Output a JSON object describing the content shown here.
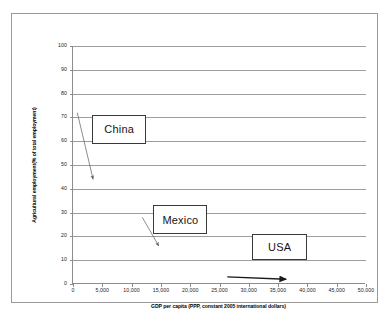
{
  "chart_data": {
    "type": "scatter",
    "title": "",
    "xlabel": "GDP per capita (PPP, constant 2005 international dollars)",
    "ylabel": "Agricultural employment(% of total employment)",
    "xlim": [
      0,
      50000
    ],
    "ylim": [
      0,
      100
    ],
    "grid": true,
    "grid_axis": "y",
    "legend": "none",
    "x_ticks": [
      "0",
      "5,000",
      "10,000",
      "15,000",
      "20,000",
      "25,000",
      "30,000",
      "35,000",
      "40,000",
      "45,000",
      "50,000"
    ],
    "x_tick_values": [
      0,
      5000,
      10000,
      15000,
      20000,
      25000,
      30000,
      35000,
      40000,
      45000,
      50000
    ],
    "y_ticks": [
      "0",
      "10",
      "20",
      "30",
      "40",
      "50",
      "60",
      "70",
      "80",
      "90",
      "100"
    ],
    "y_tick_values": [
      0,
      10,
      20,
      30,
      40,
      50,
      60,
      70,
      80,
      90,
      100
    ],
    "annotations": [
      {
        "label": "China",
        "box": {
          "x0": 3400,
          "x1": 12700,
          "y0": 59,
          "y1": 71
        },
        "arrow": {
          "x_start": 900,
          "y_start": 72,
          "x_end": 3600,
          "y_end": 44
        }
      },
      {
        "label": "Mexico",
        "box": {
          "x0": 13900,
          "x1": 23100,
          "y0": 21,
          "y1": 33
        },
        "arrow": {
          "x_start": 12000,
          "y_start": 28,
          "x_end": 14800,
          "y_end": 16
        }
      },
      {
        "label": "USA",
        "box": {
          "x0": 30800,
          "x1": 40100,
          "y0": 10,
          "y1": 21
        },
        "arrow": {
          "x_start": 26500,
          "y_start": 3,
          "x_end": 36500,
          "y_end": 2
        }
      }
    ],
    "series": [
      {
        "name": "China",
        "x": [
          900,
          3600
        ],
        "y": [
          72,
          44
        ]
      },
      {
        "name": "Mexico",
        "x": [
          12000,
          14800
        ],
        "y": [
          28,
          16
        ]
      },
      {
        "name": "USA",
        "x": [
          26500,
          36500
        ],
        "y": [
          3,
          2
        ]
      }
    ],
    "colors": {
      "axis": "#8c8c8c",
      "grid": "#9d9d9d",
      "frame": "#9a9a9a",
      "callout_border": "#3a3a3a",
      "text": "#151515",
      "arrow": "#5a5a5a",
      "arrow_usa": "#1a1a1a",
      "background": "#ffffff"
    }
  }
}
